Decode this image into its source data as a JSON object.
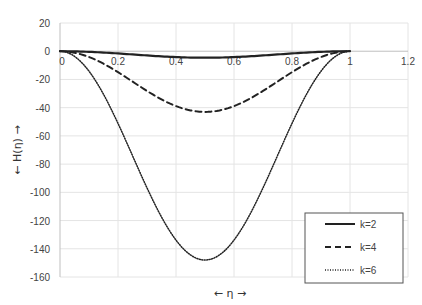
{
  "chart_data": {
    "type": "line",
    "title": "",
    "xlabel": "← η →",
    "ylabel": "← H(η) →",
    "xlim": [
      0,
      1.2
    ],
    "ylim": [
      -160,
      20
    ],
    "x_ticks": [
      "0",
      "0.2",
      "0.4",
      "0.6",
      "0.8",
      "1",
      "1.2"
    ],
    "y_ticks": [
      "20",
      "0",
      "-20",
      "-40",
      "-60",
      "-80",
      "-100",
      "-120",
      "-140",
      "-160"
    ],
    "grid": true,
    "legend_position": "lower right",
    "x": [
      0,
      0.1,
      0.2,
      0.3,
      0.4,
      0.5,
      0.6,
      0.7,
      0.8,
      0.9,
      1.0
    ],
    "series": [
      {
        "name": "k=2",
        "style": "solid",
        "values": [
          0,
          -0.4,
          -1.4,
          -2.9,
          -4.1,
          -4.6,
          -4.1,
          -2.9,
          -1.4,
          -0.4,
          0
        ]
      },
      {
        "name": "k=4",
        "style": "dashed",
        "values": [
          0,
          -4,
          -14,
          -27,
          -38,
          -43,
          -38,
          -27,
          -14,
          -4,
          0
        ]
      },
      {
        "name": "k=6",
        "style": "dotted",
        "values": [
          0,
          -14,
          -50,
          -93,
          -131,
          -148,
          -131,
          -93,
          -50,
          -14,
          0
        ]
      }
    ]
  },
  "legend": {
    "items": [
      {
        "label": "k=2"
      },
      {
        "label": "k=4"
      },
      {
        "label": "k=6"
      }
    ]
  },
  "axes": {
    "x_title": "← η →",
    "y_title": "← H(η) →"
  }
}
